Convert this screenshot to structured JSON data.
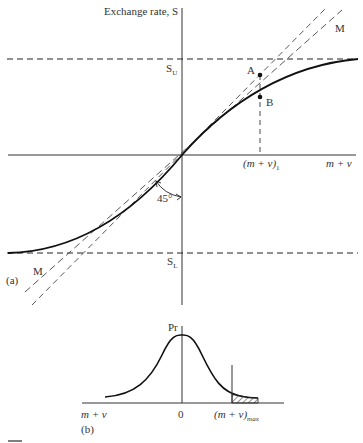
{
  "panel_a": {
    "tag": "(a)",
    "y_axis_label": "Exchange rate, S",
    "x_axis_label": "m + v",
    "upper_bound_label": "S",
    "upper_bound_sub": "U",
    "lower_bound_label": "S",
    "lower_bound_sub": "L",
    "point_a": "A",
    "point_b": "B",
    "line_label_top": "M",
    "line_label_bottom": "M",
    "angle_label": "45°",
    "x_marker_label": "(m + v)",
    "x_marker_sub": "1"
  },
  "panel_b": {
    "tag": "(b)",
    "y_axis_label": "Pr",
    "x_left_label": "m + v",
    "x_center_label": "0",
    "x_max_label": "(m + v)",
    "x_max_sub": "max"
  },
  "colors": {
    "ink": "#222222",
    "background": "#ffffff"
  }
}
